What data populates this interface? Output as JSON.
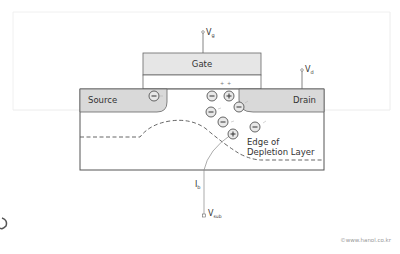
{
  "diagram": {
    "gate_label": "Gate",
    "source_label": "Source",
    "drain_label": "Drain",
    "vg_label": "V",
    "vg_sub": "g",
    "vd_label": "V",
    "vd_sub": "d",
    "vsub_label": "V",
    "vsub_sub": "sub",
    "ib_label": "I",
    "ib_sub": "b",
    "depletion_label_line1": "Edge of",
    "depletion_label_line2": "Depletion Layer",
    "minus_symbol": "−",
    "plus_symbol": "+",
    "gate_plus_marks": "+",
    "credit": "©www.hanol.co.kr"
  },
  "colors": {
    "region_fill": "#d9d9d9",
    "gate_fill": "#e6e6e6",
    "stroke": "#555555",
    "text": "#333333",
    "credit": "#999999"
  }
}
